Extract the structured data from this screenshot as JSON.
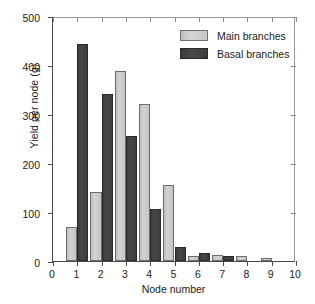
{
  "chart_data": {
    "type": "bar",
    "title": "",
    "xlabel": "Node number",
    "ylabel": "Yield per node (g)",
    "categories": [
      "1",
      "2",
      "3",
      "4",
      "5",
      "6",
      "7",
      "8",
      "9"
    ],
    "xlim": [
      0,
      10
    ],
    "ylim": [
      0,
      500
    ],
    "xticks": [
      "0",
      "1",
      "2",
      "3",
      "4",
      "5",
      "6",
      "7",
      "8",
      "9",
      "10"
    ],
    "yticks": [
      "0",
      "100",
      "200",
      "300",
      "400",
      "500"
    ],
    "grid": false,
    "legend_position": "top-right",
    "series": [
      {
        "name": "Main branches",
        "color": "#c8c8c8",
        "values": [
          69,
          140,
          388,
          320,
          156,
          11,
          13,
          10,
          7
        ]
      },
      {
        "name": "Basal branches",
        "color": "#3d3d3d",
        "values": [
          443,
          340,
          256,
          106,
          29,
          16,
          11,
          0,
          0
        ]
      }
    ]
  },
  "legend": {
    "items": [
      {
        "label": "Main branches"
      },
      {
        "label": "Basal branches"
      }
    ]
  }
}
